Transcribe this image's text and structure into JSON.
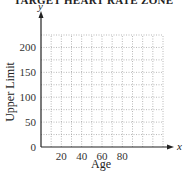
{
  "chart_data": {
    "type": "line",
    "title": "TARGET HEART RATE ZONE",
    "xlabel": "Age",
    "ylabel": "Upper Limit",
    "x_axis_var": "x",
    "y_axis_var": "y",
    "xlim": [
      0,
      120
    ],
    "ylim": [
      0,
      225
    ],
    "x_ticks": [
      20,
      40,
      60,
      80
    ],
    "y_ticks": [
      0,
      50,
      100,
      150,
      200
    ],
    "x_grid_step": 10,
    "y_grid_step": 25,
    "grid": true,
    "grid_style": "dotted",
    "series": []
  },
  "labels": {
    "title": "TARGET HEART RATE ZONE",
    "xlabel": "Age",
    "ylabel": "Upper Limit",
    "x_var": "x",
    "y_var": "y",
    "y_ticks": [
      "0",
      "50",
      "100",
      "150",
      "200"
    ],
    "x_ticks": [
      "20",
      "40",
      "60",
      "80"
    ]
  }
}
